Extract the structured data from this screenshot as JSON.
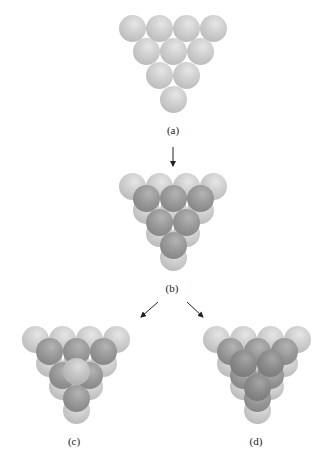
{
  "figure": {
    "panels": [
      {
        "id": "a",
        "label": "(a)",
        "description": "Single close-packed layer (4-3-2-1 triangle)"
      },
      {
        "id": "b",
        "label": "(b)",
        "description": "Second layer (3-2-1) nested in hollows of first layer"
      },
      {
        "id": "c",
        "label": "(c)",
        "description": "Third layer sphere placed directly above first-layer sphere"
      },
      {
        "id": "d",
        "label": "(d)",
        "description": "Third layer spheres placed above hollows not occupied in first layer"
      }
    ],
    "arrows": [
      {
        "from": "a",
        "to": "b"
      },
      {
        "from": "b",
        "to": "c"
      },
      {
        "from": "b",
        "to": "d"
      }
    ],
    "colors": {
      "layer1": "#c8c8c8",
      "layer2": "#8f8f8f",
      "layer3_c": "#c0c0c0",
      "layer3_d": "#808080"
    }
  }
}
